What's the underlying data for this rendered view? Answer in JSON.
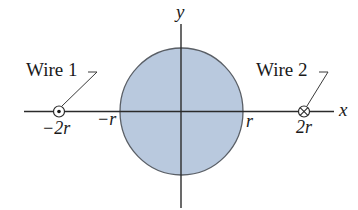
{
  "diagram": {
    "type": "physics-figure",
    "colors": {
      "circle_fill": "#b9c9de",
      "circle_stroke": "#5a5f66",
      "axis": "#2b2b2b",
      "text": "#1a1a1a"
    },
    "axes": {
      "x_label": "x",
      "y_label": "y"
    },
    "circle": {
      "label": "cylinder cross-section",
      "radius_symbol": "r"
    },
    "ticks": {
      "neg_2r": "−2r",
      "neg_r": "−r",
      "pos_r": "r",
      "pos_2r": "2r"
    },
    "wires": [
      {
        "label": "Wire 1",
        "position": "−2r",
        "current_direction": "out of page",
        "symbol": "dot-in-circle"
      },
      {
        "label": "Wire 2",
        "position": "2r",
        "current_direction": "into page",
        "symbol": "cross-in-circle"
      }
    ]
  }
}
